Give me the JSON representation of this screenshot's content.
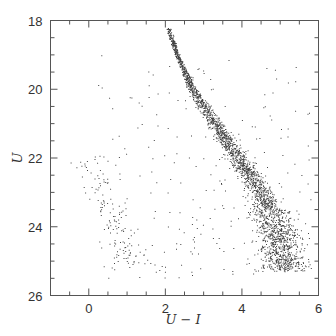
{
  "chart_data": {
    "type": "scatter",
    "title": "",
    "xlabel": "U − I",
    "ylabel": "U",
    "xlim": [
      -1,
      6
    ],
    "ylim": [
      26,
      18
    ],
    "y_inverted": true,
    "grid": false,
    "legend": null,
    "x_ticks_major": [
      0,
      2,
      4,
      6
    ],
    "x_ticks_minor_step": 0.5,
    "y_ticks_major": [
      18,
      20,
      22,
      24,
      26
    ],
    "y_ticks_minor_step": 0.5,
    "point_color": "#222222",
    "series": [
      {
        "name": "main sequence",
        "description": "dense narrow ridge of stars broadening toward faint magnitudes",
        "ridge_line": [
          {
            "x": 2.1,
            "y": 18.3
          },
          {
            "x": 2.3,
            "y": 19.0
          },
          {
            "x": 2.7,
            "y": 20.0
          },
          {
            "x": 3.3,
            "y": 21.0
          },
          {
            "x": 3.9,
            "y": 22.0
          },
          {
            "x": 4.5,
            "y": 23.0
          },
          {
            "x": 4.9,
            "y": 24.0
          },
          {
            "x": 5.1,
            "y": 25.0
          }
        ],
        "approx_count": 2500
      },
      {
        "name": "blue sequence",
        "description": "sparse diagonal sequence of blue stars",
        "ridge_line": [
          {
            "x": 0.0,
            "y": 22.2
          },
          {
            "x": 0.4,
            "y": 23.2
          },
          {
            "x": 0.8,
            "y": 24.3
          },
          {
            "x": 1.1,
            "y": 25.0
          }
        ],
        "approx_count": 120
      },
      {
        "name": "field stars",
        "description": "scattered background points across U−I 0–6, U 19–25.5",
        "approx_count": 250
      }
    ]
  },
  "axes": {
    "x_labels": [
      "0",
      "2",
      "4",
      "6"
    ],
    "y_labels": [
      "18",
      "20",
      "22",
      "24",
      "26"
    ],
    "x_title": "U − I",
    "y_title": "U"
  }
}
